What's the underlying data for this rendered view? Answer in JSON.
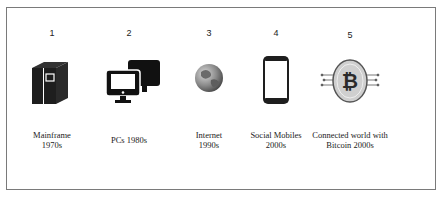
{
  "diagram": {
    "type": "timeline",
    "stages": [
      {
        "number": "1",
        "icon": "mainframe-icon",
        "label_line1": "Mainframe",
        "label_line2": "1970s"
      },
      {
        "number": "2",
        "icon": "desktop-pcs-icon",
        "label_line1": "PCs 1980s",
        "label_line2": ""
      },
      {
        "number": "3",
        "icon": "globe-icon",
        "label_line1": "Internet",
        "label_line2": "1990s"
      },
      {
        "number": "4",
        "icon": "smartphone-icon",
        "label_line1": "Social Mobiles",
        "label_line2": "2000s"
      },
      {
        "number": "5",
        "icon": "bitcoin-coin-icon",
        "label_line1": "Connected world with",
        "label_line2": "Bitcoin 2000s"
      }
    ]
  },
  "colors": {
    "border": "#7a7a7a",
    "icon_dark": "#1e1e1e",
    "coin_fill": "#cfcfcf",
    "text": "#222222"
  }
}
